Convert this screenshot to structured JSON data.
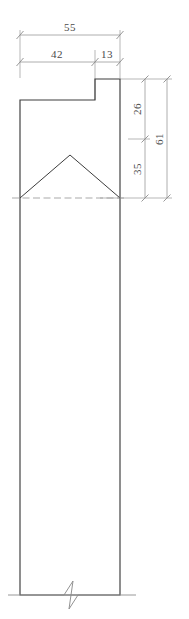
{
  "drawing": {
    "title": "Dimensioned cross-section detail",
    "type": "engineering-drawing",
    "units_note": "",
    "colors": {
      "outline": "#3c3c3c",
      "dimension": "#8c8c8c",
      "text": "#4a4a4a",
      "background": "#ffffff",
      "centerline": "#9a9a9a"
    },
    "dimensions": {
      "top": {
        "overall": "55",
        "left_segment": "42",
        "right_segment": "13"
      },
      "right": {
        "upper": "26",
        "lower": "35",
        "overall": "61"
      }
    },
    "annotations": {
      "break_symbol": "break-line",
      "centerline": "dashed-centerline"
    }
  }
}
